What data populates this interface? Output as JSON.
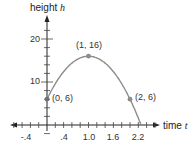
{
  "chart_data": {
    "type": "line",
    "title": "",
    "xlabel": "time",
    "xlabel_var": "t",
    "ylabel": "height",
    "ylabel_var": "h",
    "equation": "h = -10t^2 + 20t + 6",
    "x_ticks": [
      -0.4,
      0.4,
      1.0,
      1.6,
      2.2
    ],
    "x_tick_labels": [
      "-.4",
      ".4",
      "1.0",
      "1.6",
      "2.2"
    ],
    "x_minor_step": 0.2,
    "y_ticks": [
      10,
      20
    ],
    "y_tick_labels": [
      "10",
      "20"
    ],
    "y_minor_step": 2,
    "xlim": [
      -0.8,
      2.6
    ],
    "ylim": [
      0,
      24
    ],
    "grid": false,
    "series": [
      {
        "name": "height",
        "x": [
          0,
          0.2,
          0.4,
          0.6,
          0.8,
          1.0,
          1.2,
          1.4,
          1.6,
          1.8,
          2.0,
          2.2,
          2.265
        ],
        "y": [
          6,
          9.6,
          12.4,
          14.4,
          15.6,
          16,
          15.6,
          14.4,
          12.4,
          9.6,
          6,
          1.6,
          0
        ],
        "color": "#8c8c8c"
      }
    ],
    "annotations": [
      {
        "label": "(0, 6)",
        "x": 0,
        "y": 6
      },
      {
        "label": "(1, 16)",
        "x": 1,
        "y": 16
      },
      {
        "label": "(2, 6)",
        "x": 2,
        "y": 6
      }
    ]
  },
  "labels": {
    "y_axis": "height",
    "y_var": "h",
    "x_axis": "time",
    "x_var": "t",
    "y20": "20",
    "y10": "10",
    "xm04": "-.4",
    "x04": ".4",
    "x10": "1.0",
    "x16": "1.6",
    "x22": "2.2",
    "p0": "(0, 6)",
    "p1": "(1, 16)",
    "p2": "(2, 6)"
  }
}
